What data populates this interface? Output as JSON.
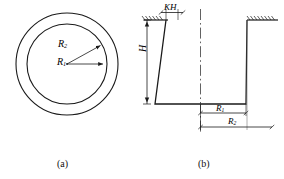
{
  "figure": {
    "panels": [
      {
        "id": "a",
        "caption": "(a)",
        "type": "plan-view-concentric-circles",
        "labels": [
          {
            "name": "outer-radius",
            "symbol": "R",
            "subscript": "2"
          },
          {
            "name": "inner-radius",
            "symbol": "R",
            "subscript": "1"
          }
        ]
      },
      {
        "id": "b",
        "caption": "(b)",
        "type": "section-view-conical-pit",
        "labels": [
          {
            "name": "top-offset",
            "symbol": "KH",
            "subscript": ""
          },
          {
            "name": "depth",
            "symbol": "H",
            "subscript": ""
          },
          {
            "name": "bottom-radius",
            "symbol": "R",
            "subscript": "1"
          },
          {
            "name": "top-radius",
            "symbol": "R",
            "subscript": "2"
          }
        ]
      }
    ],
    "symbols": {
      "r1": "R",
      "r1_sub": "1",
      "r2": "R",
      "r2_sub": "2",
      "h": "H",
      "kh": "KH"
    },
    "captions": {
      "a": "(a)",
      "b": "(b)"
    },
    "colors": {
      "line": "#1a1a1a",
      "background": "#ffffff",
      "dimension": "#333333"
    }
  }
}
